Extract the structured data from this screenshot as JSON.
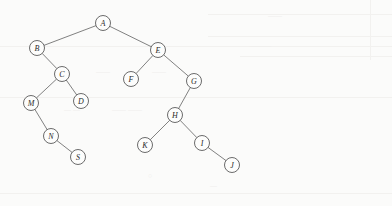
{
  "figure": {
    "kind": "binary-tree-diagram",
    "width": 392,
    "height": 206,
    "background_color": "#fbfbfa",
    "node_stroke_color": "#5a5a5a",
    "node_fill_color": "#fdfdfc",
    "edge_color": "#6a6a6a",
    "label_color": "#2b2b2b",
    "node_radius": 7.5
  },
  "nodes": [
    {
      "id": "A",
      "label": "A",
      "x": 103,
      "y": 23
    },
    {
      "id": "B",
      "label": "B",
      "x": 37,
      "y": 48
    },
    {
      "id": "E",
      "label": "E",
      "x": 158,
      "y": 50
    },
    {
      "id": "C",
      "label": "C",
      "x": 62,
      "y": 74
    },
    {
      "id": "F",
      "label": "F",
      "x": 131,
      "y": 79
    },
    {
      "id": "G",
      "label": "G",
      "x": 194,
      "y": 81
    },
    {
      "id": "M",
      "label": "M",
      "x": 31,
      "y": 103
    },
    {
      "id": "D",
      "label": "D",
      "x": 81,
      "y": 101
    },
    {
      "id": "H",
      "label": "H",
      "x": 175,
      "y": 115
    },
    {
      "id": "N",
      "label": "N",
      "x": 51,
      "y": 136
    },
    {
      "id": "K",
      "label": "K",
      "x": 145,
      "y": 145
    },
    {
      "id": "I",
      "label": "I",
      "x": 202,
      "y": 143
    },
    {
      "id": "S",
      "label": "S",
      "x": 78,
      "y": 157
    },
    {
      "id": "J",
      "label": "J",
      "x": 232,
      "y": 165
    }
  ],
  "edges": [
    {
      "from": "A",
      "to": "B"
    },
    {
      "from": "A",
      "to": "E"
    },
    {
      "from": "B",
      "to": "C"
    },
    {
      "from": "E",
      "to": "F"
    },
    {
      "from": "E",
      "to": "G"
    },
    {
      "from": "C",
      "to": "M"
    },
    {
      "from": "C",
      "to": "D"
    },
    {
      "from": "G",
      "to": "H"
    },
    {
      "from": "M",
      "to": "N"
    },
    {
      "from": "H",
      "to": "K"
    },
    {
      "from": "H",
      "to": "I"
    },
    {
      "from": "N",
      "to": "S"
    },
    {
      "from": "I",
      "to": "J"
    }
  ],
  "background_artifacts": {
    "lines": [
      {
        "x": 208,
        "y": 14,
        "w": 184,
        "h": 1
      },
      {
        "x": 208,
        "y": 36,
        "w": 184,
        "h": 1
      },
      {
        "x": 0,
        "y": 46,
        "w": 392,
        "h": 1
      },
      {
        "x": 240,
        "y": 56,
        "w": 152,
        "h": 1
      },
      {
        "x": 0,
        "y": 97,
        "w": 392,
        "h": 1
      },
      {
        "x": 0,
        "y": 193,
        "w": 392,
        "h": 1
      },
      {
        "x": 370,
        "y": 0,
        "w": 1,
        "h": 60
      }
    ],
    "smudges": [
      {
        "text": "——",
        "x": 96,
        "y": 68
      },
      {
        "text": "——",
        "x": 152,
        "y": 68
      },
      {
        "text": "— —",
        "x": 64,
        "y": 106
      },
      {
        "text": "—— ——",
        "x": 112,
        "y": 106
      },
      {
        "text": "○",
        "x": 148,
        "y": 172
      },
      {
        "text": "—",
        "x": 210,
        "y": 182
      },
      {
        "text": "——",
        "x": 268,
        "y": 12
      },
      {
        "text": "———",
        "x": 250,
        "y": 42
      }
    ]
  }
}
